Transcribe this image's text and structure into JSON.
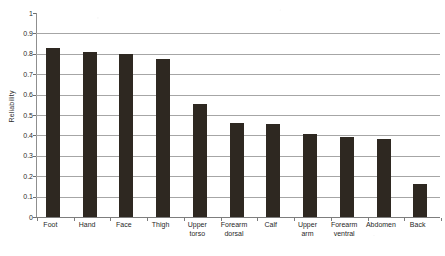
{
  "chart_data": {
    "type": "bar",
    "title": "",
    "subtitle": "",
    "xlabel": "",
    "ylabel": "Reliability",
    "categories": [
      "Foot",
      "Hand",
      "Face",
      "Thigh",
      "Upper torso",
      "Forearm dorsal",
      "Calf",
      "Upper arm",
      "Forearm ventral",
      "Abdomen",
      "Back"
    ],
    "category_lines": [
      [
        "Foot"
      ],
      [
        "Hand"
      ],
      [
        "Face"
      ],
      [
        "Thigh"
      ],
      [
        "Upper",
        "torso"
      ],
      [
        "Forearm",
        "dorsal"
      ],
      [
        "Calf"
      ],
      [
        "Upper",
        "arm"
      ],
      [
        "Forearm",
        "ventral"
      ],
      [
        "Abdomen"
      ],
      [
        "Back"
      ]
    ],
    "values": [
      0.83,
      0.81,
      0.8,
      0.775,
      0.555,
      0.46,
      0.455,
      0.405,
      0.392,
      0.382,
      0.163
    ],
    "ylim": [
      0,
      1
    ],
    "ytick_labels": [
      "1",
      "0.9",
      "0.8",
      "0.7",
      "0.6",
      "0.5",
      "0.4",
      "0.3",
      "0.2",
      "0.1",
      "0"
    ],
    "ytick_values": [
      1,
      0.9,
      0.8,
      0.7,
      0.6,
      0.5,
      0.4,
      0.3,
      0.2,
      0.1,
      0
    ],
    "grid": true,
    "legend": false,
    "bar_color": "#2e2821",
    "gridline_color": "#a6a6a6",
    "axis_color": "#7d7d7d"
  }
}
